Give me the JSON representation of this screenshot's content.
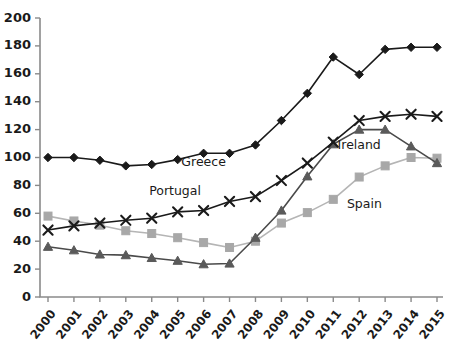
{
  "chart_data": {
    "type": "line",
    "title": "",
    "subtitle": "",
    "xlabel": "",
    "ylabel": "",
    "x": [
      2000,
      2001,
      2002,
      2003,
      2004,
      2005,
      2006,
      2007,
      2008,
      2009,
      2010,
      2011,
      2012,
      2013,
      2014,
      2015
    ],
    "xtick_labels": [
      "2000",
      "2001",
      "2002",
      "2003",
      "2004",
      "2005",
      "2006",
      "2007",
      "2008",
      "2009",
      "2010",
      "2011",
      "2012",
      "2013",
      "2014",
      "2015"
    ],
    "ytick_labels": [
      "0",
      "20",
      "40",
      "60",
      "80",
      "100",
      "120",
      "140",
      "160",
      "180",
      "200"
    ],
    "yticks": [
      0,
      20,
      40,
      60,
      80,
      100,
      120,
      140,
      160,
      180,
      200
    ],
    "ylim": [
      0,
      200
    ],
    "xlim": [
      2000,
      2015
    ],
    "grid": false,
    "legend_position": "inline-annotations",
    "series": [
      {
        "name": "Greece",
        "marker": "diamond",
        "color": "#1a1a1a",
        "line_color": "#1a1a1a",
        "label_x": 2006.0,
        "label_y": 94,
        "values": [
          100,
          100,
          98,
          94,
          95,
          98.5,
          103,
          103,
          109,
          126.5,
          146,
          172,
          159.5,
          177.5,
          179,
          179
        ]
      },
      {
        "name": "Portugal",
        "marker": "x",
        "color": "#1a1a1a",
        "line_color": "#1a1a1a",
        "label_x": 2004.9,
        "label_y": 73,
        "values": [
          48,
          51,
          53,
          55,
          56.5,
          61,
          62,
          68.5,
          72,
          83.5,
          96,
          111,
          126.5,
          129.5,
          131,
          129.5
        ]
      },
      {
        "name": "Ireland",
        "marker": "triangle",
        "color": "#5a5a5a",
        "line_color": "#4a4a4a",
        "label_x": 2012.0,
        "label_y": 106,
        "values": [
          36,
          33.5,
          30.5,
          30,
          28,
          26,
          23.5,
          24,
          42.5,
          62,
          86.5,
          109.5,
          120,
          120,
          108,
          96
        ]
      },
      {
        "name": "Spain",
        "marker": "square",
        "color": "#a8a8a8",
        "line_color": "#b5b5b5",
        "label_x": 2012.2,
        "label_y": 64,
        "values": [
          58,
          54.5,
          51.5,
          47.5,
          45.5,
          42.5,
          39,
          35.5,
          40,
          53,
          60.5,
          70,
          86,
          94,
          100,
          99.5
        ]
      }
    ]
  }
}
